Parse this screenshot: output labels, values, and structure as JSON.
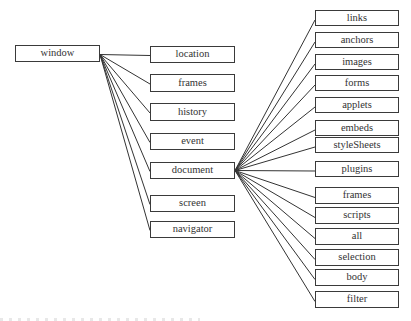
{
  "diagram": {
    "type": "tree",
    "root": {
      "id": "window",
      "label": "window",
      "box": {
        "x": 15,
        "y": 45,
        "w": 85,
        "h": 17
      }
    },
    "level1": [
      {
        "id": "location",
        "label": "location",
        "box": {
          "x": 150,
          "y": 46,
          "w": 85,
          "h": 17
        }
      },
      {
        "id": "frames",
        "label": "frames",
        "box": {
          "x": 150,
          "y": 74,
          "w": 85,
          "h": 18
        }
      },
      {
        "id": "history",
        "label": "history",
        "box": {
          "x": 150,
          "y": 103,
          "w": 85,
          "h": 18
        }
      },
      {
        "id": "event",
        "label": "event",
        "box": {
          "x": 150,
          "y": 133,
          "w": 85,
          "h": 17
        }
      },
      {
        "id": "document",
        "label": "document",
        "box": {
          "x": 150,
          "y": 162,
          "w": 85,
          "h": 17
        }
      },
      {
        "id": "screen",
        "label": "screen",
        "box": {
          "x": 150,
          "y": 195,
          "w": 85,
          "h": 17
        }
      },
      {
        "id": "navigator",
        "label": "navigator",
        "box": {
          "x": 150,
          "y": 221,
          "w": 85,
          "h": 17
        }
      }
    ],
    "document_children": [
      {
        "id": "links",
        "label": "links",
        "box": {
          "x": 315,
          "y": 10,
          "w": 84,
          "h": 16
        }
      },
      {
        "id": "anchors",
        "label": "anchors",
        "box": {
          "x": 315,
          "y": 32,
          "w": 84,
          "h": 16
        }
      },
      {
        "id": "images",
        "label": "images",
        "box": {
          "x": 315,
          "y": 54,
          "w": 84,
          "h": 16
        }
      },
      {
        "id": "forms",
        "label": "forms",
        "box": {
          "x": 315,
          "y": 75,
          "w": 84,
          "h": 16
        }
      },
      {
        "id": "applets",
        "label": "applets",
        "box": {
          "x": 315,
          "y": 97,
          "w": 84,
          "h": 16
        }
      },
      {
        "id": "embeds",
        "label": "embeds",
        "box": {
          "x": 315,
          "y": 120,
          "w": 84,
          "h": 16
        }
      },
      {
        "id": "styleSheets",
        "label": "styleSheets",
        "box": {
          "x": 315,
          "y": 137,
          "w": 84,
          "h": 16
        }
      },
      {
        "id": "plugins",
        "label": "plugins",
        "box": {
          "x": 315,
          "y": 161,
          "w": 84,
          "h": 16
        }
      },
      {
        "id": "frames2",
        "label": "frames",
        "box": {
          "x": 315,
          "y": 187,
          "w": 84,
          "h": 17
        }
      },
      {
        "id": "scripts",
        "label": "scripts",
        "box": {
          "x": 315,
          "y": 207,
          "w": 84,
          "h": 17
        }
      },
      {
        "id": "all",
        "label": "all",
        "box": {
          "x": 315,
          "y": 228,
          "w": 84,
          "h": 17
        }
      },
      {
        "id": "selection",
        "label": "selection",
        "box": {
          "x": 315,
          "y": 249,
          "w": 84,
          "h": 17
        }
      },
      {
        "id": "body",
        "label": "body",
        "box": {
          "x": 315,
          "y": 269,
          "w": 84,
          "h": 17
        }
      },
      {
        "id": "filter",
        "label": "filter",
        "box": {
          "x": 315,
          "y": 291,
          "w": 84,
          "h": 17
        }
      }
    ],
    "edge_color": "#333333",
    "border_color": "#3a3a3a",
    "text_color": "#333333"
  }
}
